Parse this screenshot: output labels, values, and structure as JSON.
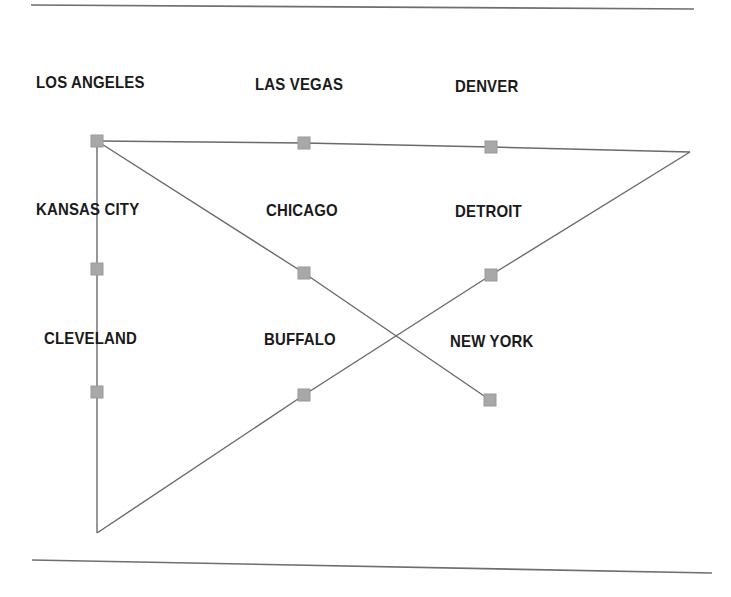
{
  "figure": {
    "type": "node-link-diagram",
    "background_color": "#ffffff",
    "rule_color": "#6e6e6e",
    "line_color": "#6a6a6a",
    "marker_color": "#a8a8a8",
    "marker_border_color": "#999999",
    "label_color": "#1a1a1a",
    "rules": [
      {
        "name": "top-rule",
        "x1": 31,
        "y1": 5,
        "x2": 694,
        "y2": 9
      },
      {
        "name": "bottom-rule",
        "x1": 32,
        "y1": 560,
        "x2": 712,
        "y2": 573
      }
    ],
    "nodes": [
      {
        "id": "los-angeles",
        "label": "LOS ANGELES",
        "x": 97,
        "y": 141,
        "label_x": 36,
        "label_y": 74,
        "marker": true
      },
      {
        "id": "las-vegas",
        "label": "LAS VEGAS",
        "x": 304,
        "y": 143,
        "label_x": 255,
        "label_y": 76,
        "marker": true
      },
      {
        "id": "denver",
        "label": "DENVER",
        "x": 491,
        "y": 147,
        "label_x": 455,
        "label_y": 78,
        "marker": true
      },
      {
        "id": "kansas-city",
        "label": "KANSAS CITY",
        "x": 97,
        "y": 269,
        "label_x": 36,
        "label_y": 201,
        "marker": true
      },
      {
        "id": "chicago",
        "label": "CHICAGO",
        "x": 304,
        "y": 273,
        "label_x": 266,
        "label_y": 202,
        "marker": true
      },
      {
        "id": "detroit",
        "label": "DETROIT",
        "x": 491,
        "y": 275,
        "label_x": 455,
        "label_y": 203,
        "marker": true
      },
      {
        "id": "cleveland",
        "label": "CLEVELAND",
        "x": 97,
        "y": 392,
        "label_x": 44,
        "label_y": 330,
        "marker": true
      },
      {
        "id": "buffalo",
        "label": "BUFFALO",
        "x": 304,
        "y": 395,
        "label_x": 264,
        "label_y": 331,
        "marker": true
      },
      {
        "id": "new-york",
        "label": "NEW YORK",
        "x": 490,
        "y": 400,
        "label_x": 450,
        "label_y": 333,
        "marker": true
      }
    ],
    "vertices": [
      {
        "id": "right-vertex",
        "x": 690,
        "y": 152
      },
      {
        "id": "bottom-vertex",
        "x": 97,
        "y": 533
      }
    ],
    "edges": [
      {
        "id": "top-polyline",
        "points": "97,141 304,143 491,147 690,152"
      },
      {
        "id": "left-vertical",
        "points": "97,141 97,269 97,392 97,533"
      },
      {
        "id": "descending-diagonal",
        "points": "97,141 304,273 490,400"
      },
      {
        "id": "ascending-diagonal",
        "points": "97,533 304,395 491,275 690,152"
      }
    ]
  }
}
